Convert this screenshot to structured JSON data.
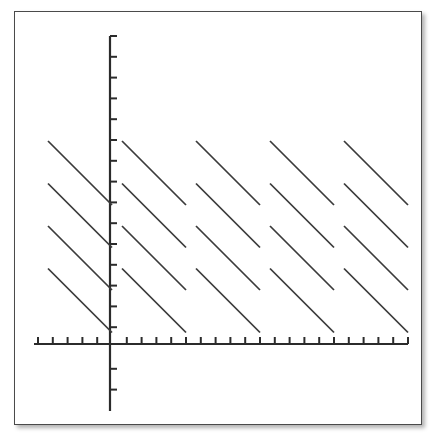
{
  "figure": {
    "title": "",
    "background_color": "#ffffff",
    "frame": {
      "border_color": "#4a4a4a",
      "has_drop_shadow": true,
      "x": 14,
      "y": 11,
      "width": 408,
      "height": 414
    }
  },
  "chart_data": {
    "type": "line",
    "title": "",
    "xlabel": "",
    "ylabel": "",
    "grid": false,
    "legend": null,
    "axes": {
      "x_axis": {
        "color": "#2b2b2b",
        "pixel_y": 344,
        "pixel_x_start": 34,
        "pixel_x_end": 408,
        "tick_count": 26,
        "tick_spacing_px": 14.8,
        "tick_direction": "up",
        "tick_length_px": 7,
        "tick_labels": [],
        "origin_pixel_x": 110
      },
      "y_axis": {
        "color": "#2b2b2b",
        "pixel_x": 110,
        "pixel_y_start": 36,
        "pixel_y_end": 411,
        "tick_count": 18,
        "tick_spacing_px": 20.8,
        "tick_direction": "right",
        "tick_length_px": 7,
        "tick_labels": [],
        "origin_pixel_y": 344
      }
    },
    "series": [
      {
        "name": "sawtooth-segments",
        "slope": -1,
        "period_px": 74,
        "segment_run_px": 64,
        "segment_vertical_offset_px": 42.5,
        "segments_per_period": 4,
        "period_count": 5,
        "period_start_x": [
          48,
          122,
          196,
          270,
          344
        ],
        "segment_start_y": [
          141,
          183.5,
          226,
          268.5
        ],
        "segments": [
          {
            "x1": 48,
            "y1": 141,
            "x2": 112,
            "y2": 205
          },
          {
            "x1": 48,
            "y1": 183.5,
            "x2": 112,
            "y2": 247.5
          },
          {
            "x1": 48,
            "y1": 226,
            "x2": 112,
            "y2": 290
          },
          {
            "x1": 48,
            "y1": 268.5,
            "x2": 112,
            "y2": 332.5
          },
          {
            "x1": 122,
            "y1": 141,
            "x2": 186,
            "y2": 205
          },
          {
            "x1": 122,
            "y1": 183.5,
            "x2": 186,
            "y2": 247.5
          },
          {
            "x1": 122,
            "y1": 226,
            "x2": 186,
            "y2": 290
          },
          {
            "x1": 122,
            "y1": 268.5,
            "x2": 186,
            "y2": 332.5
          },
          {
            "x1": 196,
            "y1": 141,
            "x2": 260,
            "y2": 205
          },
          {
            "x1": 196,
            "y1": 183.5,
            "x2": 260,
            "y2": 247.5
          },
          {
            "x1": 196,
            "y1": 226,
            "x2": 260,
            "y2": 290
          },
          {
            "x1": 196,
            "y1": 268.5,
            "x2": 260,
            "y2": 332.5
          },
          {
            "x1": 270,
            "y1": 141,
            "x2": 334,
            "y2": 205
          },
          {
            "x1": 270,
            "y1": 183.5,
            "x2": 334,
            "y2": 247.5
          },
          {
            "x1": 270,
            "y1": 226,
            "x2": 334,
            "y2": 290
          },
          {
            "x1": 270,
            "y1": 268.5,
            "x2": 334,
            "y2": 332.5
          },
          {
            "x1": 344,
            "y1": 141,
            "x2": 408,
            "y2": 205
          },
          {
            "x1": 344,
            "y1": 183.5,
            "x2": 408,
            "y2": 247.5
          },
          {
            "x1": 344,
            "y1": 226,
            "x2": 408,
            "y2": 290
          },
          {
            "x1": 344,
            "y1": 268.5,
            "x2": 408,
            "y2": 332.5
          }
        ],
        "color": "#3a3a3a"
      }
    ]
  }
}
